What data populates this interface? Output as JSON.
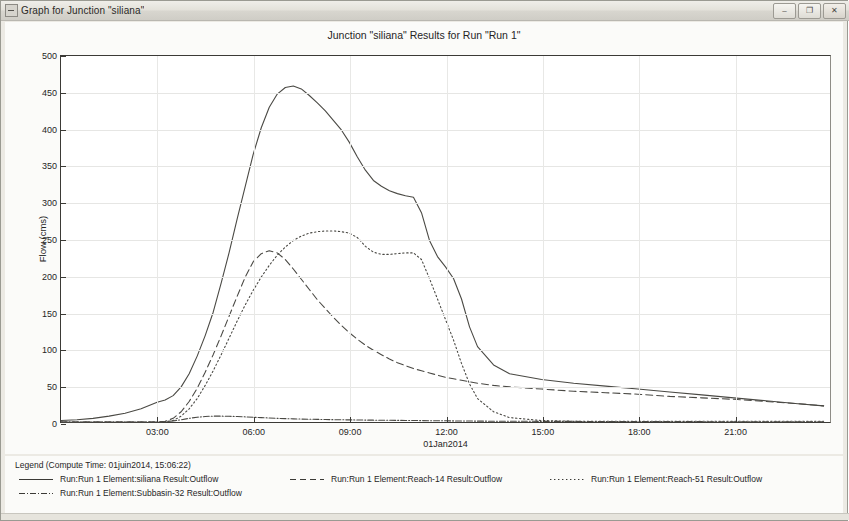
{
  "window": {
    "title": "Graph for Junction \"siliana\"",
    "icon": "graph-window-icon",
    "buttons": {
      "minimize": "–",
      "restore": "❐",
      "close": "✕"
    }
  },
  "legend": {
    "header": "Legend (Compute Time: 01juin2014, 15:06:22)",
    "entries": [
      {
        "label": "Run:Run 1 Element:siliana Result:Outflow",
        "style": "solid"
      },
      {
        "label": "Run:Run 1 Element:Subbasin-32 Result:Outflow",
        "style": "dash-dot"
      },
      {
        "label": "Run:Run 1 Element:Reach-14 Result:Outflow",
        "style": "dashed"
      },
      {
        "label": "Run:Run 1 Element:Reach-51 Result:Outflow",
        "style": "dotted"
      }
    ]
  },
  "chart_data": {
    "type": "line",
    "title": "Junction \"siliana\" Results for Run \"Run 1\"",
    "xlabel": "01Jan2014",
    "ylabel": "Flow (cms)",
    "ylim": [
      0,
      500
    ],
    "yticks": [
      0,
      50,
      100,
      150,
      200,
      250,
      300,
      350,
      400,
      450,
      500
    ],
    "xlim": [
      0,
      24
    ],
    "xticks": [
      3,
      6,
      9,
      12,
      15,
      18,
      21
    ],
    "xtick_labels": [
      "03:00",
      "06:00",
      "09:00",
      "12:00",
      "15:00",
      "18:00",
      "21:00"
    ],
    "grid": true,
    "legend_position": "below",
    "x": [
      0,
      0.5,
      1,
      1.5,
      2,
      2.5,
      3,
      3.25,
      3.5,
      3.75,
      4,
      4.25,
      4.5,
      4.75,
      5,
      5.25,
      5.5,
      5.75,
      6,
      6.25,
      6.5,
      6.75,
      7,
      7.25,
      7.5,
      7.75,
      8,
      8.25,
      8.5,
      8.75,
      9,
      9.25,
      9.5,
      9.75,
      10,
      10.25,
      10.5,
      10.75,
      11,
      11.25,
      11.5,
      11.75,
      12,
      12.25,
      12.5,
      12.75,
      13,
      13.5,
      14,
      15,
      16,
      17,
      18,
      19,
      20,
      21,
      22,
      23,
      23.8
    ],
    "series": [
      {
        "name": "Run:Run 1 Element:siliana Result:Outflow",
        "style": "solid",
        "values": [
          2,
          3,
          5,
          8,
          12,
          18,
          27,
          30,
          36,
          48,
          66,
          90,
          118,
          150,
          190,
          232,
          278,
          322,
          366,
          402,
          430,
          448,
          457,
          459,
          455,
          446,
          436,
          425,
          412,
          399,
          382,
          362,
          344,
          330,
          322,
          316,
          312,
          309,
          307,
          286,
          248,
          226,
          212,
          196,
          168,
          130,
          103,
          78,
          66,
          58,
          53,
          49,
          45,
          41,
          37,
          33,
          29,
          25,
          22
        ]
      },
      {
        "name": "Run:Run 1 Element:Subbasin-32 Result:Outflow",
        "style": "dash-dot",
        "values": [
          0,
          0,
          0,
          0,
          0,
          0,
          0,
          0.5,
          1.5,
          3,
          5,
          6.5,
          7.5,
          8,
          8,
          7.8,
          7.5,
          7,
          6.5,
          6,
          5.5,
          5,
          4.6,
          4.3,
          4,
          3.8,
          3.6,
          3.4,
          3.2,
          3,
          2.9,
          2.8,
          2.6,
          2.5,
          2.4,
          2.3,
          2.2,
          2.1,
          2,
          1.9,
          1.8,
          1.7,
          1.6,
          1.5,
          1.4,
          1.3,
          1.2,
          1.1,
          1,
          0.9,
          0.8,
          0.7,
          0.6,
          0.5,
          0.45,
          0.4,
          0.35,
          0.3,
          0.25
        ]
      },
      {
        "name": "Run:Run 1 Element:Reach-14 Result:Outflow",
        "style": "dashed",
        "values": [
          0,
          0,
          0,
          0,
          0,
          0,
          0,
          1,
          5,
          14,
          28,
          46,
          68,
          92,
          118,
          145,
          172,
          198,
          219,
          230,
          234,
          231,
          222,
          209,
          195,
          181,
          167,
          155,
          143,
          132,
          122,
          113,
          105,
          98,
          92,
          86,
          81,
          77,
          73,
          70,
          67,
          64,
          61,
          59,
          57,
          55,
          53,
          50,
          48,
          45,
          42,
          40,
          38,
          35,
          33,
          31,
          28,
          25,
          22
        ]
      },
      {
        "name": "Run:Run 1 Element:Reach-51 Result:Outflow",
        "style": "dotted",
        "values": [
          0,
          0,
          0,
          0,
          0,
          0,
          0,
          0,
          2,
          8,
          18,
          32,
          50,
          70,
          92,
          115,
          138,
          160,
          180,
          198,
          214,
          228,
          239,
          248,
          254,
          258,
          260,
          261,
          261,
          260,
          258,
          252,
          240,
          232,
          229,
          229,
          230,
          231,
          231,
          222,
          196,
          168,
          140,
          112,
          80,
          52,
          32,
          14,
          6,
          2,
          1,
          1,
          1,
          1,
          1,
          1,
          1,
          1,
          1
        ]
      }
    ]
  }
}
